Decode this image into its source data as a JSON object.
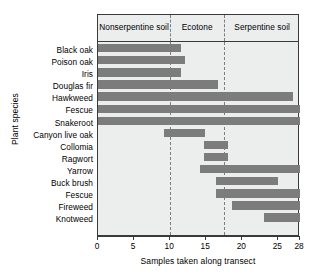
{
  "chart_data": {
    "type": "bar",
    "orientation": "horizontal",
    "subtype": "range-bar",
    "title": "",
    "xlabel": "Samples taken along transect",
    "ylabel": "Plant species",
    "xlim": [
      0,
      28
    ],
    "ylim": null,
    "grid": false,
    "legend": null,
    "xticks": [
      0,
      5,
      10,
      15,
      20,
      25,
      28
    ],
    "xtick_labels": [
      "0",
      "5",
      "10",
      "15",
      "20",
      "25",
      "28"
    ],
    "categories": [
      "Black oak",
      "Poison oak",
      "Iris",
      "Douglas fir",
      "Hawkweed",
      "Fescue",
      "Snakeroot",
      "Canyon live oak",
      "Collomia",
      "Ragwort",
      "Yarrow",
      "Buck brush",
      "Fescue",
      "Fireweed",
      "Knotweed"
    ],
    "bars": [
      {
        "label": "Black oak",
        "start": 0,
        "end": 11.5
      },
      {
        "label": "Poison oak",
        "start": 0,
        "end": 12.0
      },
      {
        "label": "Iris",
        "start": 0,
        "end": 11.5
      },
      {
        "label": "Douglas fir",
        "start": 0,
        "end": 16.6
      },
      {
        "label": "Hawkweed",
        "start": 0,
        "end": 27.0
      },
      {
        "label": "Fescue",
        "start": 0,
        "end": 28.0
      },
      {
        "label": "Snakeroot",
        "start": 0,
        "end": 28.0
      },
      {
        "label": "Canyon live oak",
        "start": 9.2,
        "end": 14.9
      },
      {
        "label": "Collomia",
        "start": 14.7,
        "end": 18.0
      },
      {
        "label": "Ragwort",
        "start": 14.7,
        "end": 18.0
      },
      {
        "label": "Yarrow",
        "start": 14.1,
        "end": 28.0
      },
      {
        "label": "Buck brush",
        "start": 16.4,
        "end": 25.0
      },
      {
        "label": "Fescue",
        "start": 16.4,
        "end": 28.0
      },
      {
        "label": "Fireweed",
        "start": 18.6,
        "end": 28.0
      },
      {
        "label": "Knotweed",
        "start": 23.0,
        "end": 28.0
      }
    ],
    "zones": [
      {
        "label": "Nonserpentine soil",
        "start": 0,
        "end": 10.0
      },
      {
        "label": "Ecotone",
        "start": 10.0,
        "end": 17.5
      },
      {
        "label": "Serpentine soil",
        "start": 17.5,
        "end": 28.0
      }
    ],
    "zone_dividers": [
      10.0,
      17.5
    ],
    "colors": {
      "bar": "#7c7c7c",
      "plot_background": "#eceded",
      "axis": "#3a3a3a",
      "divider": "#7d7d7d",
      "text": "#000000"
    }
  }
}
